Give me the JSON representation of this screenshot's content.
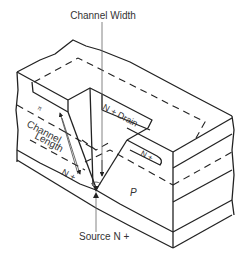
{
  "diagram": {
    "labels": {
      "channel_width": "Channel Width",
      "drain": "N + Drain",
      "channel_length_line1": "Channel",
      "channel_length_line2": "Length",
      "n_plus_left": "N +",
      "n_plus_right": "N +",
      "p_region": "P",
      "source": "Source N +",
      "pi_mark": "π"
    },
    "colors": {
      "line": "#222222",
      "text": "#333333",
      "background": "#ffffff"
    }
  }
}
